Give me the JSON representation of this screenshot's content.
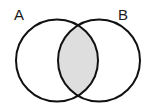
{
  "diagram": {
    "type": "venn-diagram",
    "sets": [
      {
        "id": "A",
        "label": "A",
        "label_x": 14,
        "label_y": 20,
        "circle": {
          "cx": 57,
          "cy": 60.5,
          "r": 41
        },
        "stroke": "#111111",
        "fill": "#ffffff"
      },
      {
        "id": "B",
        "label": "B",
        "label_x": 118,
        "label_y": 20,
        "circle": {
          "cx": 99,
          "cy": 60.5,
          "r": 41
        },
        "stroke": "#111111",
        "fill": "#ffffff"
      }
    ],
    "intersection": {
      "label": "",
      "fill": "#dedede",
      "stroke": "#111111",
      "shaded": true
    },
    "colors": {
      "background": "#ffffff",
      "outline": "#111111",
      "shade": "#dedede",
      "text": "#1a1a1a"
    },
    "stroke_width": 2
  }
}
